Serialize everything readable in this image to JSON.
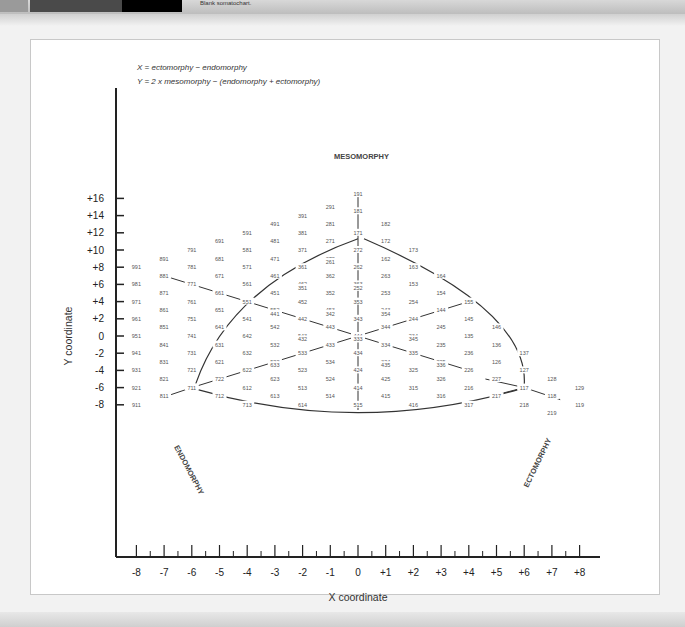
{
  "header": {
    "figure_label": "FIGURE",
    "figure_number": "13.3",
    "caption": "Blank somatochart."
  },
  "formulas": {
    "x": "X = ectomorphy − endomorphy",
    "y": "Y = 2 x mesomorphy − (endomorphy + ectomorphy)"
  },
  "components": {
    "meso": "MESOMORPHY",
    "endo": "ENDOMORPHY",
    "ecto": "ECTOMORPHY"
  },
  "colors": {
    "line": "#333333",
    "label": "#555555",
    "axis": "#222222"
  },
  "chart_data": {
    "type": "scatter",
    "title": "Blank somatochart",
    "xlabel": "X coordinate",
    "ylabel": "Y coordinate",
    "xlim": [
      -8,
      8
    ],
    "ylim": [
      -9,
      17
    ],
    "x_ticks": [
      "-8",
      "-7",
      "-6",
      "-5",
      "-4",
      "-3",
      "-2",
      "-1",
      "0",
      "+1",
      "+2",
      "+3",
      "+4",
      "+5",
      "+6",
      "+7",
      "+8"
    ],
    "y_ticks": [
      "+16",
      "+14",
      "+12",
      "+10",
      "+8",
      "+6",
      "+4",
      "+2",
      "0",
      "-2",
      "-4",
      "-6",
      "-8"
    ],
    "grid": false,
    "annotations": [
      "X = ectomorphy − endomorphy",
      "Y = 2 x mesomorphy − (endomorphy + ectomorphy)",
      "MESOMORPHY",
      "ENDOMORPHY",
      "ECTOMORPHY"
    ],
    "points": [
      {
        "label": "191",
        "x": 0,
        "y": 16.5
      },
      {
        "label": "291",
        "x": -1,
        "y": 15
      },
      {
        "label": "181",
        "x": 0,
        "y": 14.5
      },
      {
        "label": "391",
        "x": -2,
        "y": 14
      },
      {
        "label": "281",
        "x": -1,
        "y": 13
      },
      {
        "label": "182",
        "x": 1,
        "y": 13
      },
      {
        "label": "491",
        "x": -3,
        "y": 13
      },
      {
        "label": "171",
        "x": 0,
        "y": 12
      },
      {
        "label": "591",
        "x": -4,
        "y": 12
      },
      {
        "label": "381",
        "x": -2,
        "y": 12
      },
      {
        "label": "691",
        "x": -5,
        "y": 11
      },
      {
        "label": "481",
        "x": -3,
        "y": 11
      },
      {
        "label": "271",
        "x": -1,
        "y": 11
      },
      {
        "label": "172",
        "x": 1,
        "y": 11
      },
      {
        "label": "791",
        "x": -6,
        "y": 10
      },
      {
        "label": "581",
        "x": -4,
        "y": 10
      },
      {
        "label": "371",
        "x": -2,
        "y": 10
      },
      {
        "label": "272",
        "x": 0,
        "y": 10
      },
      {
        "label": "173",
        "x": 2,
        "y": 10
      },
      {
        "label": "891",
        "x": -7,
        "y": 9
      },
      {
        "label": "681",
        "x": -5,
        "y": 9
      },
      {
        "label": "471",
        "x": -3,
        "y": 9
      },
      {
        "label": "372",
        "x": -1,
        "y": 9
      },
      {
        "label": "261",
        "x": -1,
        "y": 8.6
      },
      {
        "label": "162",
        "x": 1,
        "y": 9
      },
      {
        "label": "991",
        "x": -8,
        "y": 8
      },
      {
        "label": "781",
        "x": -6,
        "y": 8
      },
      {
        "label": "571",
        "x": -4,
        "y": 8
      },
      {
        "label": "361",
        "x": -2,
        "y": 8
      },
      {
        "label": "262",
        "x": 0,
        "y": 8
      },
      {
        "label": "163",
        "x": 2,
        "y": 8
      },
      {
        "label": "881",
        "x": -7,
        "y": 7
      },
      {
        "label": "671",
        "x": -5,
        "y": 7
      },
      {
        "label": "461",
        "x": -3,
        "y": 7
      },
      {
        "label": "362",
        "x": -1,
        "y": 7
      },
      {
        "label": "263",
        "x": 1,
        "y": 7
      },
      {
        "label": "164",
        "x": 3,
        "y": 7
      },
      {
        "label": "981",
        "x": -8,
        "y": 6
      },
      {
        "label": "771",
        "x": -6,
        "y": 6
      },
      {
        "label": "561",
        "x": -4,
        "y": 6
      },
      {
        "label": "462",
        "x": -2,
        "y": 6
      },
      {
        "label": "351",
        "x": -2,
        "y": 5.6
      },
      {
        "label": "363",
        "x": 0,
        "y": 6
      },
      {
        "label": "252",
        "x": 0,
        "y": 5.6
      },
      {
        "label": "153",
        "x": 2,
        "y": 6
      },
      {
        "label": "871",
        "x": -7,
        "y": 5
      },
      {
        "label": "661",
        "x": -5,
        "y": 5
      },
      {
        "label": "451",
        "x": -3,
        "y": 5
      },
      {
        "label": "352",
        "x": -1,
        "y": 5
      },
      {
        "label": "253",
        "x": 1,
        "y": 5
      },
      {
        "label": "154",
        "x": 3,
        "y": 5
      },
      {
        "label": "971",
        "x": -8,
        "y": 4
      },
      {
        "label": "761",
        "x": -6,
        "y": 4
      },
      {
        "label": "551",
        "x": -4,
        "y": 4
      },
      {
        "label": "452",
        "x": -2,
        "y": 4
      },
      {
        "label": "353",
        "x": 0,
        "y": 4
      },
      {
        "label": "254",
        "x": 2,
        "y": 4
      },
      {
        "label": "155",
        "x": 4,
        "y": 4
      },
      {
        "label": "861",
        "x": -7,
        "y": 3
      },
      {
        "label": "651",
        "x": -5,
        "y": 3
      },
      {
        "label": "552",
        "x": -3,
        "y": 3
      },
      {
        "label": "441",
        "x": -3,
        "y": 2.6
      },
      {
        "label": "453",
        "x": -1,
        "y": 3
      },
      {
        "label": "342",
        "x": -1,
        "y": 2.6
      },
      {
        "label": "243",
        "x": 1,
        "y": 3
      },
      {
        "label": "354",
        "x": 1,
        "y": 2.6
      },
      {
        "label": "144",
        "x": 3,
        "y": 3
      },
      {
        "label": "961",
        "x": -8,
        "y": 2
      },
      {
        "label": "751",
        "x": -6,
        "y": 2
      },
      {
        "label": "541",
        "x": -4,
        "y": 2
      },
      {
        "label": "442",
        "x": -2,
        "y": 2
      },
      {
        "label": "343",
        "x": 0,
        "y": 2
      },
      {
        "label": "244",
        "x": 2,
        "y": 2
      },
      {
        "label": "145",
        "x": 4,
        "y": 2
      },
      {
        "label": "851",
        "x": -7,
        "y": 1
      },
      {
        "label": "641",
        "x": -5,
        "y": 1
      },
      {
        "label": "542",
        "x": -3,
        "y": 1
      },
      {
        "label": "443",
        "x": -1,
        "y": 1
      },
      {
        "label": "344",
        "x": 1,
        "y": 1
      },
      {
        "label": "245",
        "x": 3,
        "y": 1
      },
      {
        "label": "146",
        "x": 5,
        "y": 1
      },
      {
        "label": "951",
        "x": -8,
        "y": 0
      },
      {
        "label": "741",
        "x": -6,
        "y": 0
      },
      {
        "label": "642",
        "x": -4,
        "y": 0
      },
      {
        "label": "543",
        "x": -2,
        "y": 0
      },
      {
        "label": "432",
        "x": -2,
        "y": -0.4
      },
      {
        "label": "444",
        "x": 0,
        "y": 0
      },
      {
        "label": "333",
        "x": 0,
        "y": -0.4
      },
      {
        "label": "234",
        "x": 2,
        "y": 0
      },
      {
        "label": "345",
        "x": 2,
        "y": -0.4
      },
      {
        "label": "135",
        "x": 4,
        "y": 0
      },
      {
        "label": "841",
        "x": -7,
        "y": -1
      },
      {
        "label": "631",
        "x": -5,
        "y": -1
      },
      {
        "label": "532",
        "x": -3,
        "y": -1
      },
      {
        "label": "433",
        "x": -1,
        "y": -1
      },
      {
        "label": "334",
        "x": 1,
        "y": -1
      },
      {
        "label": "235",
        "x": 3,
        "y": -1
      },
      {
        "label": "136",
        "x": 5,
        "y": -1
      },
      {
        "label": "941",
        "x": -8,
        "y": -2
      },
      {
        "label": "731",
        "x": -6,
        "y": -2
      },
      {
        "label": "632",
        "x": -4,
        "y": -2
      },
      {
        "label": "533",
        "x": -2,
        "y": -2
      },
      {
        "label": "434",
        "x": 0,
        "y": -2
      },
      {
        "label": "335",
        "x": 2,
        "y": -2
      },
      {
        "label": "236",
        "x": 4,
        "y": -2
      },
      {
        "label": "137",
        "x": 6,
        "y": -2
      },
      {
        "label": "831",
        "x": -7,
        "y": -3
      },
      {
        "label": "621",
        "x": -5,
        "y": -3
      },
      {
        "label": "522",
        "x": -3,
        "y": -3
      },
      {
        "label": "633",
        "x": -3,
        "y": -3.4
      },
      {
        "label": "534",
        "x": -1,
        "y": -3
      },
      {
        "label": "324",
        "x": 1,
        "y": -3
      },
      {
        "label": "435",
        "x": 1,
        "y": -3.4
      },
      {
        "label": "225",
        "x": 3,
        "y": -3
      },
      {
        "label": "336",
        "x": 3,
        "y": -3.4
      },
      {
        "label": "126",
        "x": 5,
        "y": -3
      },
      {
        "label": "931",
        "x": -8,
        "y": -4
      },
      {
        "label": "721",
        "x": -6,
        "y": -4
      },
      {
        "label": "622",
        "x": -4,
        "y": -4
      },
      {
        "label": "523",
        "x": -2,
        "y": -4
      },
      {
        "label": "424",
        "x": 0,
        "y": -4
      },
      {
        "label": "325",
        "x": 2,
        "y": -4
      },
      {
        "label": "226",
        "x": 4,
        "y": -4
      },
      {
        "label": "127",
        "x": 6,
        "y": -4
      },
      {
        "label": "821",
        "x": -7,
        "y": -5
      },
      {
        "label": "722",
        "x": -5,
        "y": -5
      },
      {
        "label": "623",
        "x": -3,
        "y": -5
      },
      {
        "label": "524",
        "x": -1,
        "y": -5
      },
      {
        "label": "425",
        "x": 1,
        "y": -5
      },
      {
        "label": "326",
        "x": 3,
        "y": -5
      },
      {
        "label": "227",
        "x": 5,
        "y": -5
      },
      {
        "label": "128",
        "x": 7,
        "y": -5
      },
      {
        "label": "921",
        "x": -8,
        "y": -6
      },
      {
        "label": "711",
        "x": -6,
        "y": -6
      },
      {
        "label": "612",
        "x": -4,
        "y": -6
      },
      {
        "label": "513",
        "x": -2,
        "y": -6
      },
      {
        "label": "414",
        "x": 0,
        "y": -6
      },
      {
        "label": "315",
        "x": 2,
        "y": -6
      },
      {
        "label": "216",
        "x": 4,
        "y": -6
      },
      {
        "label": "117",
        "x": 6,
        "y": -6
      },
      {
        "label": "129",
        "x": 8,
        "y": -6
      },
      {
        "label": "811",
        "x": -7,
        "y": -7
      },
      {
        "label": "712",
        "x": -5,
        "y": -7
      },
      {
        "label": "613",
        "x": -3,
        "y": -7
      },
      {
        "label": "514",
        "x": -1,
        "y": -7
      },
      {
        "label": "415",
        "x": 1,
        "y": -7
      },
      {
        "label": "316",
        "x": 3,
        "y": -7
      },
      {
        "label": "217",
        "x": 5,
        "y": -7
      },
      {
        "label": "118",
        "x": 7,
        "y": -7
      },
      {
        "label": "911",
        "x": -8,
        "y": -8
      },
      {
        "label": "713",
        "x": -4,
        "y": -8
      },
      {
        "label": "614",
        "x": -2,
        "y": -8
      },
      {
        "label": "515",
        "x": 0,
        "y": -8
      },
      {
        "label": "416",
        "x": 2,
        "y": -8
      },
      {
        "label": "317",
        "x": 4,
        "y": -8
      },
      {
        "label": "218",
        "x": 6,
        "y": -8
      },
      {
        "label": "119",
        "x": 8,
        "y": -8
      },
      {
        "label": "219",
        "x": 7,
        "y": -9
      }
    ]
  }
}
